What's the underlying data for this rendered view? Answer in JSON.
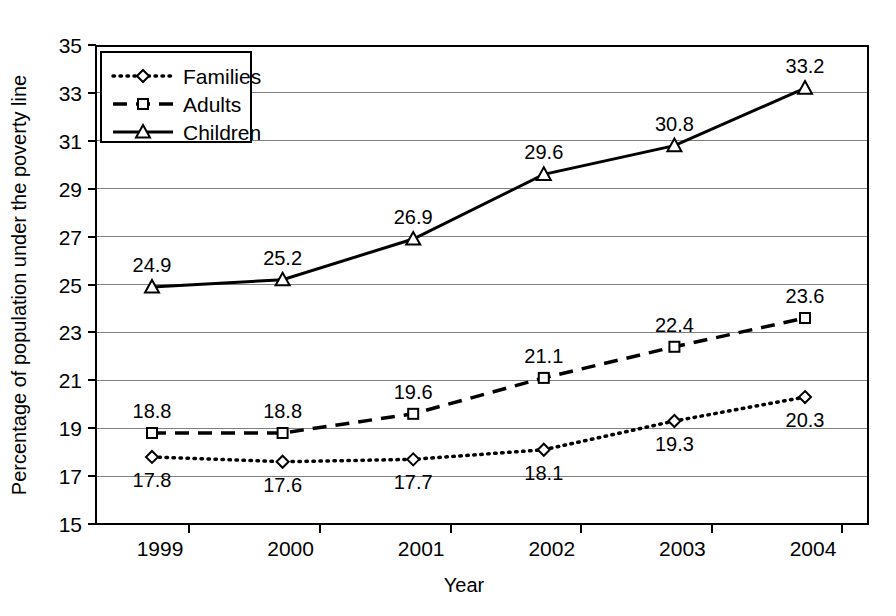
{
  "chart_data": {
    "type": "line",
    "title": "",
    "xlabel": "Year",
    "ylabel": "Percentage of population under the poverty line",
    "categories": [
      "1999",
      "2000",
      "2001",
      "2002",
      "2003",
      "2004"
    ],
    "ylim": [
      15,
      35
    ],
    "yticks": [
      "15",
      "17",
      "19",
      "21",
      "23",
      "25",
      "27",
      "29",
      "31",
      "33",
      "35"
    ],
    "grid": true,
    "legend_position": "top-left",
    "series": [
      {
        "name": "Families",
        "style": "dotted",
        "marker": "diamond",
        "label_position": "below",
        "values": [
          17.8,
          17.6,
          17.7,
          18.1,
          19.3,
          20.3
        ],
        "labels": [
          "17.8",
          "17.6",
          "17.7",
          "18.1",
          "19.3",
          "20.3"
        ]
      },
      {
        "name": "Adults",
        "style": "dashed",
        "marker": "square",
        "label_position": "above",
        "values": [
          18.8,
          18.8,
          19.6,
          21.1,
          22.4,
          23.6
        ],
        "labels": [
          "18.8",
          "18.8",
          "19.6",
          "21.1",
          "22.4",
          "23.6"
        ]
      },
      {
        "name": "Children",
        "style": "solid",
        "marker": "triangle",
        "label_position": "above",
        "values": [
          24.9,
          25.2,
          26.9,
          29.6,
          30.8,
          33.2
        ],
        "labels": [
          "24.9",
          "25.2",
          "26.9",
          "29.6",
          "30.8",
          "33.2"
        ]
      }
    ],
    "colors": {
      "line": "#000000",
      "grid": "#808080",
      "axis": "#000000",
      "background": "#ffffff"
    }
  }
}
